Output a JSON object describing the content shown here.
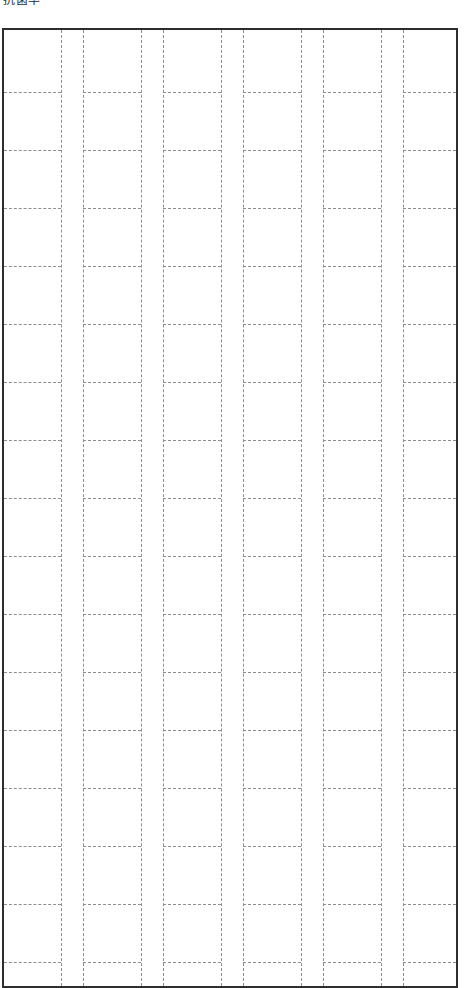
{
  "page": {
    "width": 465,
    "height": 977,
    "background_color": "#ffffff"
  },
  "header": {
    "caption": "抗菌率",
    "note": "three CJK glyphs, clipped by the top edge of the screenshot"
  },
  "sheet": {
    "name": "cjk-manuscript-grid",
    "border_color": "#2e2e2e",
    "border_width_px": 2,
    "rule_color": "#8e8e8e",
    "rule_style": "dashed",
    "left_px": 2,
    "top_px": 28,
    "width_px": 456,
    "height_px": 960,
    "clipped_at_bottom": true
  },
  "grid": {
    "type": "writing-grid",
    "cell_size_px": 58,
    "gutter_size_px": 22,
    "row_height_px": 58,
    "column_group_count": 6,
    "columns_per_group": 1,
    "visible_row_count": 16,
    "column_x_positions": [
      59,
      81,
      139,
      161,
      219,
      241,
      299,
      321,
      379,
      401
    ],
    "row_y_positions": [
      64,
      122,
      180,
      238,
      296,
      354,
      412,
      470,
      528,
      586,
      644,
      702,
      760,
      818,
      876,
      934
    ],
    "cell_spans": [
      {
        "start_px": 0,
        "end_px": 59
      },
      {
        "start_px": 81,
        "end_px": 139
      },
      {
        "start_px": 161,
        "end_px": 219
      },
      {
        "start_px": 241,
        "end_px": 299
      },
      {
        "start_px": 321,
        "end_px": 379
      },
      {
        "start_px": 401,
        "end_px": 456
      }
    ],
    "cell_contents": []
  }
}
